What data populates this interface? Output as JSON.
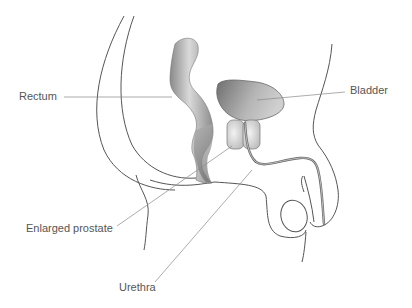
{
  "diagram": {
    "type": "anatomical-illustration",
    "labels": [
      {
        "id": "rectum",
        "text": "Rectum"
      },
      {
        "id": "bladder",
        "text": "Bladder"
      },
      {
        "id": "enlarged-prostate",
        "text": "Enlarged prostate"
      },
      {
        "id": "urethra",
        "text": "Urethra"
      }
    ],
    "colors": {
      "outline": "#555555",
      "leader_line": "#777777",
      "label_text": "#555555",
      "organ_dark": "#7a7a7a",
      "organ_light": "#d8d8d8",
      "prostate_fill": "#d4d4d4",
      "urethra": "#6a6a6a"
    }
  }
}
